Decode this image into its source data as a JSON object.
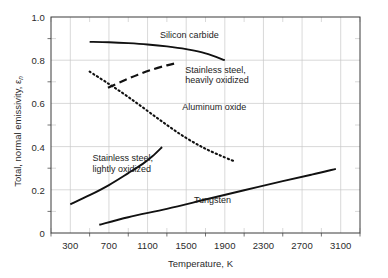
{
  "chart_data": {
    "type": "line",
    "title": "",
    "xlabel": "Temperature, K",
    "ylabel": "Total, normal emissivity, ε",
    "ylabel_subscript": "n",
    "xlim": [
      100,
      3300
    ],
    "ylim": [
      0,
      1.0
    ],
    "xticks": [
      300,
      700,
      1100,
      1500,
      1900,
      2300,
      2700,
      3100
    ],
    "xtick_labels": [
      "300",
      "700",
      "1100",
      "1500",
      "1900",
      "2300",
      "2700",
      "3100"
    ],
    "xminor_step": 200,
    "yticks": [
      0,
      0.2,
      0.4,
      0.6,
      0.8,
      1.0
    ],
    "ytick_labels": [
      "0",
      "0.2",
      "0.4",
      "0.6",
      "0.8",
      "1.0"
    ],
    "yminor_step": 0.1,
    "grid": true,
    "grid_color": "#c8c8c8",
    "axis_color": "#3a3a3a",
    "line_color": "#111111",
    "legend": "inline-labels",
    "series": [
      {
        "name": "Silicon carbide",
        "style": "solid",
        "label_x": 1230,
        "label_y": 0.915,
        "x": [
          500,
          700,
          900,
          1100,
          1300,
          1500,
          1700,
          1900
        ],
        "y": [
          0.885,
          0.883,
          0.879,
          0.873,
          0.864,
          0.851,
          0.832,
          0.8
        ]
      },
      {
        "name": "Stainless steel, heavily oxidized",
        "style": "dashed",
        "label_x": 1490,
        "label_y": 0.755,
        "label_line2": "heavily oxidized",
        "x": [
          690,
          850,
          1000,
          1150,
          1300,
          1400
        ],
        "y": [
          0.672,
          0.705,
          0.733,
          0.757,
          0.776,
          0.787
        ]
      },
      {
        "name": "Aluminum oxide",
        "style": "dotted",
        "label_x": 1460,
        "label_y": 0.585,
        "x": [
          500,
          700,
          900,
          1100,
          1300,
          1500,
          1700,
          1900,
          2000
        ],
        "y": [
          0.747,
          0.69,
          0.63,
          0.565,
          0.5,
          0.44,
          0.39,
          0.35,
          0.332
        ]
      },
      {
        "name": "Stainless steel, lightly oxidized",
        "style": "solid",
        "label_x": 530,
        "label_y": 0.345,
        "label_line2": "lightly oxidized",
        "x": [
          300,
          500,
          700,
          900,
          1050,
          1150,
          1250
        ],
        "y": [
          0.133,
          0.175,
          0.222,
          0.277,
          0.32,
          0.355,
          0.398
        ]
      },
      {
        "name": "Tungsten",
        "style": "solid",
        "label_x": 1580,
        "label_y": 0.155,
        "x": [
          600,
          900,
          1300,
          1700,
          2100,
          2500,
          2800,
          3050
        ],
        "y": [
          0.038,
          0.073,
          0.112,
          0.155,
          0.198,
          0.24,
          0.27,
          0.297
        ]
      }
    ]
  }
}
